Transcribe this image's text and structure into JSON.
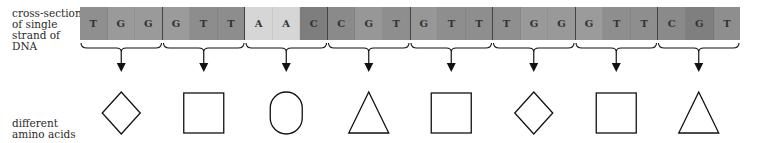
{
  "labels": {
    "dna": "cross-section of single strand of DNA",
    "amino_acids": "different amino acids"
  },
  "strip": {
    "bases": [
      {
        "letter": "T",
        "color": "#8f8f8f"
      },
      {
        "letter": "G",
        "color": "#9a9a9a"
      },
      {
        "letter": "G",
        "color": "#9a9a9a"
      },
      {
        "letter": "G",
        "color": "#9b9b9b"
      },
      {
        "letter": "T",
        "color": "#8d8d8d"
      },
      {
        "letter": "T",
        "color": "#8d8d8d"
      },
      {
        "letter": "A",
        "color": "#d6d6d6"
      },
      {
        "letter": "A",
        "color": "#d6d6d6"
      },
      {
        "letter": "C",
        "color": "#7e7e7e"
      },
      {
        "letter": "C",
        "color": "#8a8a8a"
      },
      {
        "letter": "G",
        "color": "#979797"
      },
      {
        "letter": "T",
        "color": "#8e8e8e"
      },
      {
        "letter": "G",
        "color": "#979797"
      },
      {
        "letter": "T",
        "color": "#8e8e8e"
      },
      {
        "letter": "T",
        "color": "#8e8e8e"
      },
      {
        "letter": "T",
        "color": "#8f8f8f"
      },
      {
        "letter": "G",
        "color": "#999999"
      },
      {
        "letter": "G",
        "color": "#999999"
      },
      {
        "letter": "G",
        "color": "#9b9b9b"
      },
      {
        "letter": "T",
        "color": "#8e8e8e"
      },
      {
        "letter": "T",
        "color": "#8e8e8e"
      },
      {
        "letter": "C",
        "color": "#8a8a8a"
      },
      {
        "letter": "G",
        "color": "#7f7f7f"
      },
      {
        "letter": "T",
        "color": "#8e8e8e"
      }
    ]
  },
  "codons": [
    {
      "bases": "TGG",
      "amino_acid_shape": "diamond"
    },
    {
      "bases": "GTT",
      "amino_acid_shape": "square"
    },
    {
      "bases": "AAC",
      "amino_acid_shape": "oval"
    },
    {
      "bases": "CGT",
      "amino_acid_shape": "triangle"
    },
    {
      "bases": "GTT",
      "amino_acid_shape": "square"
    },
    {
      "bases": "TGG",
      "amino_acid_shape": "diamond"
    },
    {
      "bases": "GTT",
      "amino_acid_shape": "square"
    },
    {
      "bases": "CGT",
      "amino_acid_shape": "triangle"
    }
  ],
  "colors": {
    "stroke": "#111111",
    "label_text": "#2a2a2a"
  }
}
